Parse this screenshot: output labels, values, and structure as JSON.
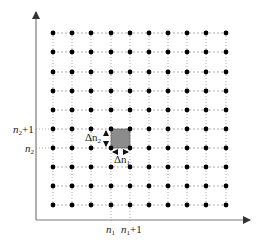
{
  "diagram": {
    "type": "lattice-grid",
    "columns": 10,
    "rows": 10,
    "grid_x": [
      53,
      72,
      91,
      111,
      130,
      149,
      168,
      187,
      206,
      226
    ],
    "grid_y": [
      33,
      52,
      72,
      91,
      110,
      129,
      148,
      167,
      186,
      205
    ],
    "axis_origin": [
      36,
      220
    ],
    "x_axis_end": [
      250,
      220
    ],
    "y_axis_end": [
      36,
      12
    ],
    "highlight_cell": {
      "col_from": 3,
      "col_to": 4,
      "row_from": 5,
      "row_to": 6
    },
    "colors": {
      "dot": "#000000",
      "grid_line": "#9a9a9a",
      "axis": "#7a7a7a",
      "cell_fill": "#8c8c8c"
    }
  },
  "labels": {
    "n1": "n",
    "n1_sub": "1",
    "n1_plus": "n",
    "n1_plus_sub": "1",
    "n1_plus_suffix": "+1",
    "n2": "n",
    "n2_sub": "2",
    "n2_plus": "n",
    "n2_plus_sub": "2",
    "n2_plus_suffix": "+1",
    "delta_n1": "Δn",
    "delta_n1_sub": "1",
    "delta_n2": "Δn",
    "delta_n2_sub": "2"
  }
}
